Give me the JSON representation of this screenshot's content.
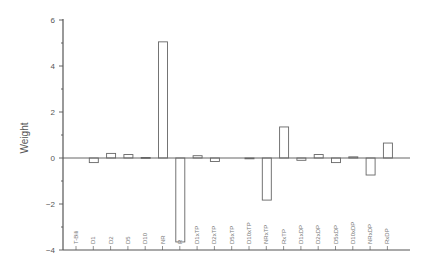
{
  "chart_data": {
    "type": "bar",
    "title": "",
    "xlabel": "",
    "ylabel": "Weight",
    "ylim": [
      -4,
      6
    ],
    "yticks": [
      -4,
      -2,
      0,
      2,
      4,
      6
    ],
    "grid": false,
    "legend": null,
    "categories": [
      "T-Bili",
      "D1",
      "D2",
      "D5",
      "D10",
      "NR",
      "R",
      "D1xTP",
      "D2xTP",
      "D5xTP",
      "D10xTP",
      "NRxTP",
      "RxTP",
      "D1xDP",
      "D2xDP",
      "D5xDP",
      "D10xDP",
      "NRxDP",
      "RxDP"
    ],
    "values": [
      0.0,
      -0.2,
      0.2,
      0.15,
      0.02,
      5.05,
      -3.65,
      0.1,
      -0.15,
      0.0,
      -0.02,
      -1.83,
      1.35,
      -0.1,
      0.15,
      -0.2,
      0.05,
      -0.74,
      0.65
    ]
  },
  "colors": {
    "axis": "#555555",
    "bar_stroke": "#666666",
    "bar_fill": "#ffffff"
  }
}
